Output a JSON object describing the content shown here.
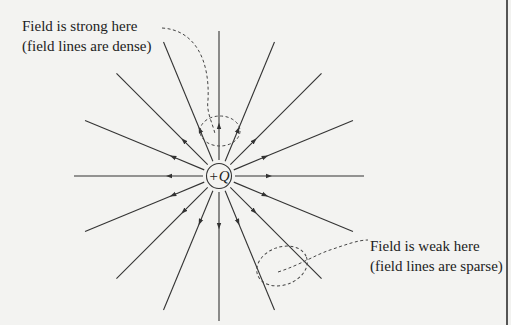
{
  "diagram": {
    "charge_label": "+Q",
    "annotations": {
      "strong": {
        "line1": "Field is strong here",
        "line2": "(field lines are dense)"
      },
      "weak": {
        "line1": "Field is weak here",
        "line2": "(field lines are sparse)"
      }
    },
    "line_count": 16,
    "field_direction": "outward",
    "colors": {
      "line": "#333333",
      "background": "#f3f3f1"
    }
  }
}
